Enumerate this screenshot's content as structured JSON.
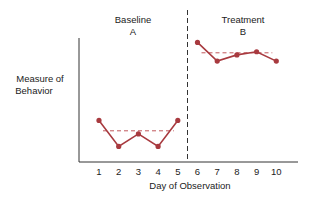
{
  "chart_data": {
    "type": "line",
    "title": "",
    "xlabel": "Day of Observation",
    "ylabel": "Measure of Behavior",
    "x": [
      1,
      2,
      3,
      4,
      5,
      6,
      7,
      8,
      9,
      10
    ],
    "phases": [
      {
        "name": "Baseline",
        "letter": "A",
        "days": [
          1,
          2,
          3,
          4,
          5
        ],
        "values": [
          4.0,
          1.5,
          2.7,
          1.5,
          4.0
        ],
        "mean": 3.0
      },
      {
        "name": "Treatment",
        "letter": "B",
        "days": [
          6,
          7,
          8,
          9,
          10
        ],
        "values": [
          11.5,
          9.7,
          10.3,
          10.6,
          9.7
        ],
        "mean": 10.5
      }
    ],
    "ylim": [
      0,
      12.5
    ],
    "grid": false,
    "legend": "none",
    "phase_divider_after_day": 5,
    "colors": {
      "series": "#a83a3f",
      "mean": "#c0585c",
      "axis": "#333333"
    }
  },
  "labels": {
    "baseline_title": "Baseline",
    "baseline_letter": "A",
    "treatment_title": "Treatment",
    "treatment_letter": "B",
    "ylabel_line1": "Measure of",
    "ylabel_line2": "Behavior",
    "xlabel": "Day of Observation",
    "ticks": [
      "1",
      "2",
      "3",
      "4",
      "5",
      "6",
      "7",
      "8",
      "9",
      "10"
    ]
  }
}
